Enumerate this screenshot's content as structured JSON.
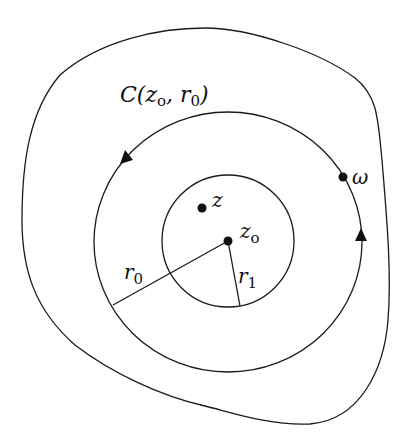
{
  "figure": {
    "colors": {
      "stroke": "#1a1a1a",
      "background": "#ffffff"
    },
    "labels": {
      "contour": {
        "main": "C(z",
        "sub_o": "o",
        "comma": ", r",
        "sub_0": "0",
        "close": ")"
      },
      "z": "z",
      "center": {
        "main": "z",
        "sub": "o"
      },
      "omega": "ω",
      "r0": {
        "main": "r",
        "sub": "0"
      },
      "r1": {
        "main": "r",
        "sub": "1"
      }
    },
    "geometry": {
      "center": [
        228,
        241
      ],
      "inner_circle_radius": 66,
      "contour_radius_x": 134,
      "contour_radius_y": 130,
      "point_z": [
        202,
        208
      ],
      "point_omega": [
        343,
        177
      ],
      "r0_endpoint": [
        113,
        305
      ],
      "r1_endpoint": [
        240,
        305
      ],
      "arrow_left": [
        123,
        158
      ],
      "arrow_right": [
        361,
        236
      ]
    }
  }
}
